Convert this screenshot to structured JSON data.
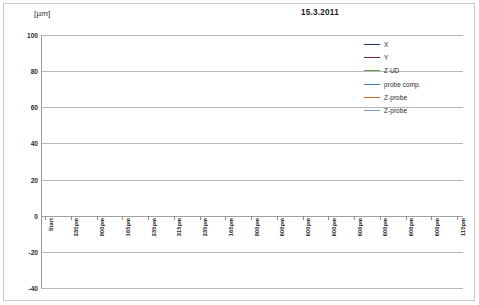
{
  "chart_data": {
    "type": "line",
    "title": "15.3.2011",
    "ylabel": "[µm]",
    "xlabel": "",
    "ylim": [
      -40,
      100
    ],
    "yticks": [
      100,
      80,
      60,
      40,
      20,
      0,
      -20,
      -40
    ],
    "grid": true,
    "legend_position": "top-right",
    "categories": [
      "Start",
      "235pm",
      "800pm",
      "165pm",
      "235pm",
      "315pm",
      "235pm",
      "165pm",
      "800pm",
      "600pm",
      "600pm",
      "600pm",
      "600pm",
      "600pm",
      "600pm",
      "600pm",
      "115pm"
    ],
    "series": [
      {
        "name": "X",
        "color": "#1f3864",
        "values": [
          0,
          1,
          5,
          3,
          4,
          4,
          3,
          3,
          1,
          0,
          -1,
          -2,
          -3,
          -3,
          -4,
          -4,
          -1
        ]
      },
      {
        "name": "Y",
        "color": "#7b2230",
        "values": [
          2,
          44,
          19,
          21,
          33,
          48,
          59,
          54,
          29,
          26,
          23,
          20,
          18,
          16,
          14,
          13,
          16
        ]
      },
      {
        "name": "Z UD",
        "color": "#5fa046",
        "values": [
          2,
          75,
          48,
          56,
          66,
          81,
          80,
          66,
          30,
          22,
          16,
          11,
          7,
          4,
          2,
          2,
          24
        ]
      },
      {
        "name": "probe comp.",
        "color": "#3d7fa6",
        "values": [
          31,
          37,
          35,
          36,
          37,
          39,
          39,
          39,
          36,
          35,
          35,
          34,
          34,
          34,
          34,
          34,
          35
        ]
      },
      {
        "name": "Z-probe",
        "color": "#d2692b",
        "values": [
          2,
          28,
          14,
          15,
          20,
          17,
          13,
          7,
          -1,
          -9,
          -14,
          -17,
          -19,
          -20,
          -21,
          -21,
          -7
        ]
      },
      {
        "name": "Z-probe",
        "color": "#6b9fd4",
        "values": [
          0,
          5,
          -3,
          -8,
          -10,
          -11,
          -13,
          -16,
          -19,
          -22,
          -24,
          -25,
          -26,
          -27,
          -28,
          -29,
          -25
        ]
      }
    ]
  },
  "legend": {
    "items": [
      {
        "label": "X"
      },
      {
        "label": "Y"
      },
      {
        "label": "Z UD"
      },
      {
        "label": "probe comp."
      },
      {
        "label": "Z-probe"
      },
      {
        "label": "Z-probe"
      }
    ]
  }
}
